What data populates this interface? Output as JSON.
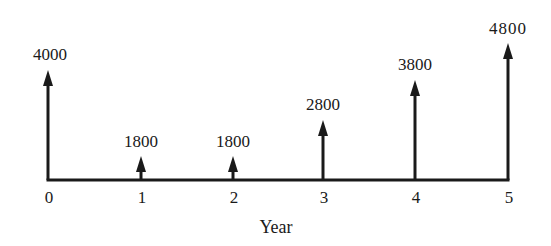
{
  "diagram": {
    "type": "cash-flow-diagram",
    "axis_label": "Year",
    "baseline_y": 180,
    "axis_x_start": 48,
    "axis_x_end": 508,
    "color": "#1a1a1a",
    "flows": [
      {
        "year": "0",
        "amount": "4000",
        "x": 48,
        "tip_y": 70,
        "label_y": 46
      },
      {
        "year": "1",
        "amount": "1800",
        "x": 141,
        "tip_y": 156,
        "label_y": 133
      },
      {
        "year": "2",
        "amount": "1800",
        "x": 233,
        "tip_y": 156,
        "label_y": 133
      },
      {
        "year": "3",
        "amount": "2800",
        "x": 323,
        "tip_y": 120,
        "label_y": 96
      },
      {
        "year": "4",
        "amount": "3800",
        "x": 415,
        "tip_y": 80,
        "label_y": 56
      },
      {
        "year": "5",
        "amount": "4800",
        "x": 508,
        "tip_y": 43,
        "label_y": 20
      }
    ]
  },
  "chart_data": {
    "type": "bar",
    "title": "",
    "xlabel": "Year",
    "ylabel": "",
    "categories": [
      "0",
      "1",
      "2",
      "3",
      "4",
      "5"
    ],
    "values": [
      4000,
      1800,
      1800,
      2800,
      3800,
      4800
    ],
    "direction": "upward arrows (receipts)",
    "grid": false,
    "legend": null
  }
}
